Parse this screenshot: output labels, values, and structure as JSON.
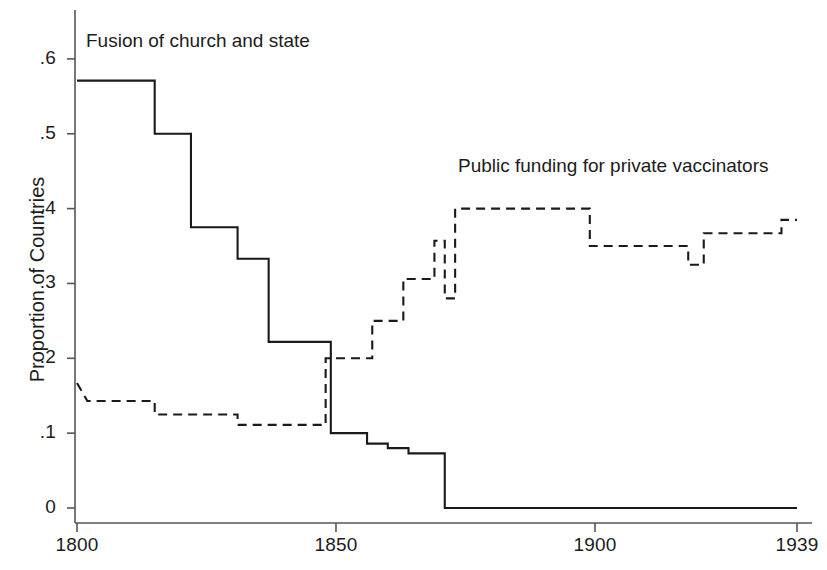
{
  "chart_data": {
    "type": "line",
    "title": "",
    "xlabel": "",
    "ylabel": "Proportion of Countries",
    "xlim": [
      1800,
      1939
    ],
    "ylim": [
      0,
      0.65
    ],
    "grid": false,
    "legend_position": "inline-annotations",
    "x_ticks": [
      1800,
      1850,
      1900,
      1939
    ],
    "x_tick_labels": [
      "1800",
      "1850",
      "1900",
      "1939"
    ],
    "y_ticks": [
      0,
      0.1,
      0.2,
      0.3,
      0.4,
      0.5,
      0.6
    ],
    "y_tick_labels": [
      "0",
      ".1",
      ".2",
      ".3",
      ".4",
      ".5",
      ".6"
    ],
    "series": [
      {
        "name": "Fusion of church and state",
        "style": "solid",
        "color": "#1a1a1a",
        "annotation": "Fusion of church and state",
        "x": [
          1800,
          1815,
          1815,
          1822,
          1822,
          1831,
          1831,
          1837,
          1837,
          1847,
          1847,
          1849,
          1849,
          1856,
          1856,
          1860,
          1860,
          1864,
          1864,
          1871,
          1871,
          1939
        ],
        "y": [
          0.571,
          0.571,
          0.5,
          0.5,
          0.375,
          0.375,
          0.333,
          0.333,
          0.222,
          0.222,
          0.222,
          0.222,
          0.1,
          0.1,
          0.086,
          0.086,
          0.08,
          0.08,
          0.073,
          0.073,
          0.0,
          0.0
        ]
      },
      {
        "name": "Public funding for private vaccinators",
        "style": "dashed",
        "color": "#1a1a1a",
        "annotation": "Public funding for private vaccinators",
        "x": [
          1800,
          1802,
          1802,
          1815,
          1815,
          1831,
          1831,
          1848,
          1848,
          1857,
          1857,
          1863,
          1863,
          1869,
          1869,
          1871,
          1871,
          1873,
          1873,
          1899,
          1899,
          1918,
          1918,
          1921,
          1921,
          1936,
          1936,
          1939
        ],
        "y": [
          0.167,
          0.143,
          0.143,
          0.143,
          0.125,
          0.125,
          0.111,
          0.111,
          0.2,
          0.2,
          0.25,
          0.25,
          0.306,
          0.306,
          0.357,
          0.357,
          0.28,
          0.28,
          0.4,
          0.4,
          0.35,
          0.35,
          0.325,
          0.325,
          0.367,
          0.367,
          0.385,
          0.385
        ]
      }
    ]
  },
  "annotations": {
    "fusion": "Fusion of church and state",
    "public_funding": "Public funding for private vaccinators"
  },
  "axes": {
    "y_label": "Proportion of Countries"
  }
}
